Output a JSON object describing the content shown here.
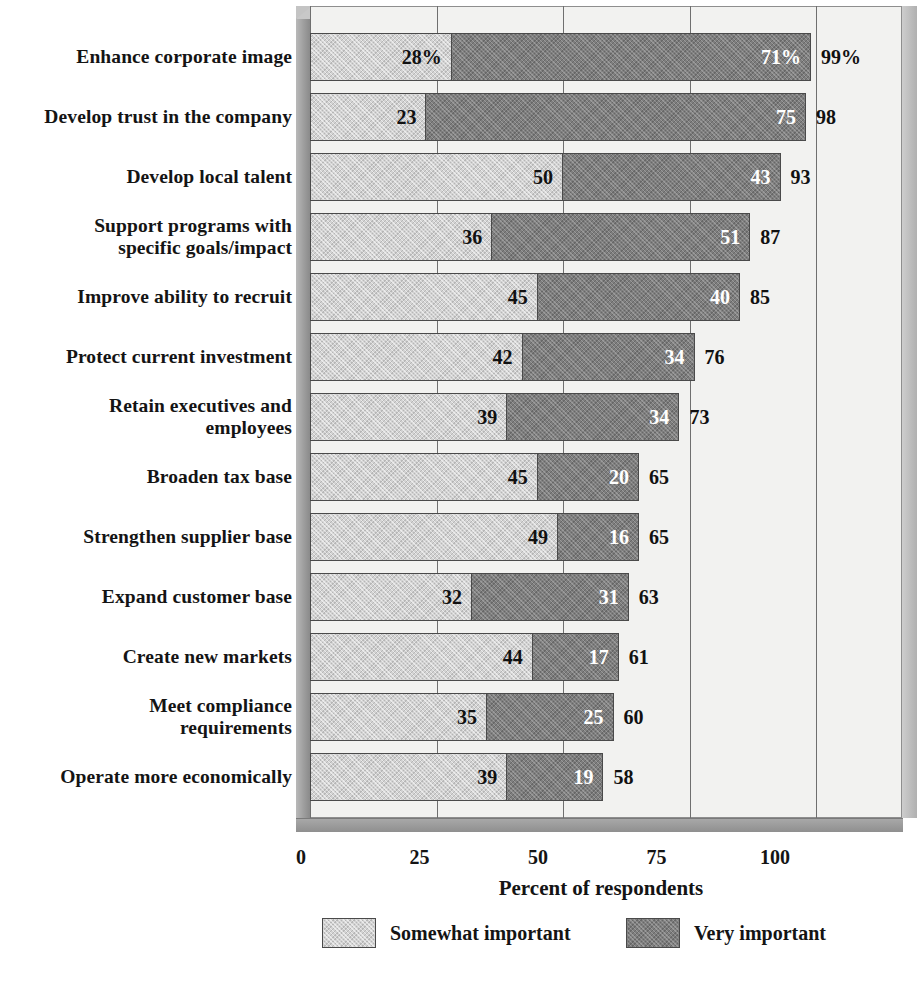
{
  "chart_data": {
    "type": "bar",
    "subtype": "horizontal-stacked",
    "title": "",
    "xlabel": "Percent of respondents",
    "ylabel": "",
    "xlim": [
      0,
      100
    ],
    "xticks": [
      0,
      25,
      50,
      75,
      100
    ],
    "xtick_labels": [
      "0",
      "25",
      "50",
      "75",
      "100"
    ],
    "grid": true,
    "grid_axis": "x",
    "legend_position": "bottom",
    "categories": [
      "Enhance corporate image",
      "Develop trust in the company",
      "Develop local talent",
      "Support programs with\nspecific goals/impact",
      "Improve ability to recruit",
      "Protect current investment",
      "Retain executives and\nemployees",
      "Broaden tax base",
      "Strengthen supplier base",
      "Expand customer base",
      "Create new markets",
      "Meet compliance\nrequirements",
      "Operate more economically"
    ],
    "series": [
      {
        "name": "Somewhat important",
        "color": "#d2d2d2",
        "values": [
          28,
          23,
          50,
          36,
          45,
          42,
          39,
          45,
          49,
          32,
          44,
          35,
          39
        ],
        "labels": [
          "28%",
          "23",
          "50",
          "36",
          "45",
          "42",
          "39",
          "45",
          "49",
          "32",
          "44",
          "35",
          "39"
        ]
      },
      {
        "name": "Very important",
        "color": "#7e7e7e",
        "values": [
          71,
          75,
          43,
          51,
          40,
          34,
          34,
          20,
          16,
          31,
          17,
          25,
          19
        ],
        "labels": [
          "71%",
          "75",
          "43",
          "51",
          "40",
          "34",
          "34",
          "20",
          "16",
          "31",
          "17",
          "25",
          "19"
        ]
      }
    ],
    "totals": [
      99,
      98,
      93,
      87,
      85,
      76,
      73,
      65,
      65,
      63,
      61,
      60,
      58
    ],
    "total_labels": [
      "99%",
      "98",
      "93",
      "87",
      "85",
      "76",
      "73",
      "65",
      "65",
      "63",
      "61",
      "60",
      "58"
    ]
  },
  "legend": {
    "items": [
      {
        "label": "Somewhat important",
        "color": "#d2d2d2"
      },
      {
        "label": "Very important",
        "color": "#7e7e7e"
      }
    ]
  },
  "axis": {
    "x_title": "Percent of respondents"
  }
}
